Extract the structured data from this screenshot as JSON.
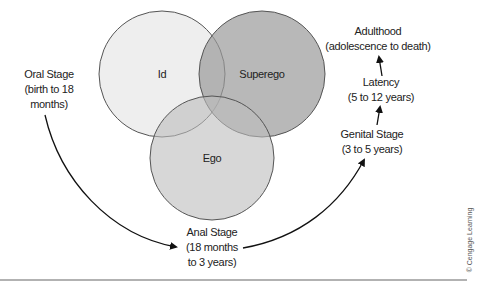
{
  "diagram": {
    "circles": [
      {
        "label": "Id",
        "fill": "#ececec"
      },
      {
        "label": "Superego",
        "fill": "#b4b4b4"
      },
      {
        "label": "Ego",
        "fill": "#d2d2d2"
      }
    ],
    "stages": {
      "oral": {
        "line1": "Oral Stage",
        "line2": "(birth to 18",
        "line3": "months)"
      },
      "anal": {
        "line1": "Anal Stage",
        "line2": "(18 months",
        "line3": "to 3 years)"
      },
      "genital": {
        "line1": "Genital Stage",
        "line2": "(3 to 5 years)"
      },
      "latency": {
        "line1": "Latency",
        "line2": "(5 to 12 years)"
      },
      "adulthood": {
        "line1": "Adulthood",
        "line2": "(adolescence to death)"
      }
    },
    "copyright": "© Cengage Learning"
  }
}
